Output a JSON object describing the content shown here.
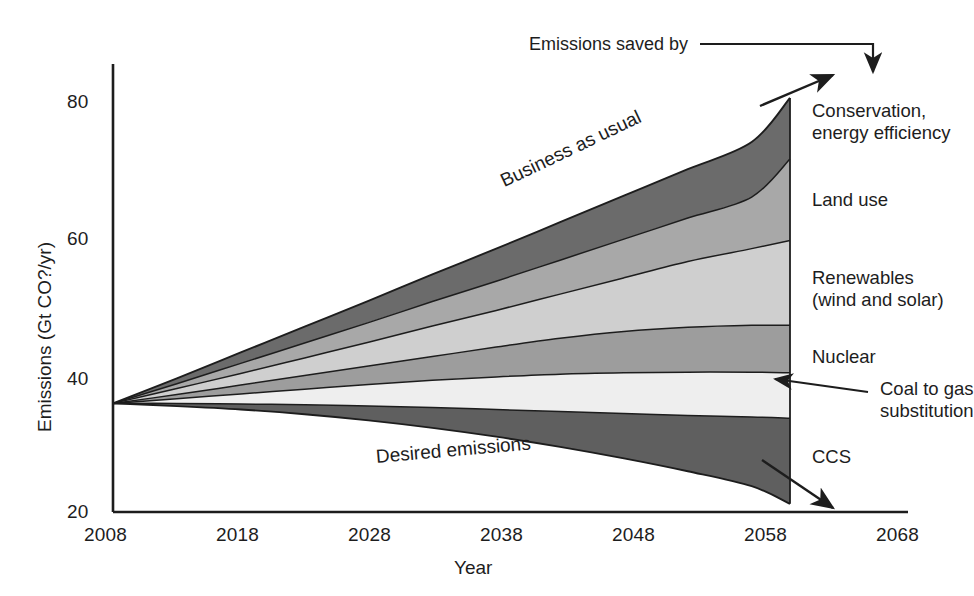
{
  "figure": {
    "background": "#ffffff",
    "ink": "#1d1d1d"
  },
  "axes": {
    "y_title": "Emissions (Gt CO?/yr)",
    "x_title": "Year",
    "y_ticks": [
      "80",
      "60",
      "40",
      "20"
    ],
    "x_ticks": [
      "2008",
      "2018",
      "2028",
      "2038",
      "2048",
      "2058",
      "2068"
    ]
  },
  "annotations": {
    "business_as_usual": "Business as usual",
    "desired_emissions": "Desired emissions",
    "emissions_saved_by": "Emissions saved by"
  },
  "band_labels": [
    {
      "id": "conservation",
      "line1": "Conservation,",
      "line2": "energy efficiency"
    },
    {
      "id": "land-use",
      "line1": "Land use",
      "line2": ""
    },
    {
      "id": "renewables",
      "line1": "Renewables",
      "line2": "(wind and solar)"
    },
    {
      "id": "nuclear",
      "line1": "Nuclear",
      "line2": ""
    },
    {
      "id": "coal-to-gas",
      "line1": "Coal to gas",
      "line2": "substitution"
    },
    {
      "id": "ccs",
      "line1": "CCS",
      "line2": ""
    }
  ],
  "chart_data": {
    "type": "area",
    "title": "",
    "xlabel": "Year",
    "ylabel": "Emissions (Gt CO?/yr)",
    "xlim": [
      2008,
      2068
    ],
    "ylim": [
      20,
      86
    ],
    "grid": false,
    "legend_position": "right-inline-labels",
    "x": [
      2008,
      2013,
      2018,
      2023,
      2028,
      2033,
      2038,
      2043,
      2048,
      2053,
      2058,
      2061
    ],
    "boundaries": [
      {
        "name": "Business as usual (top of stack)",
        "values": [
          36.0,
          39.7,
          43.5,
          47.3,
          51.1,
          55.0,
          58.8,
          62.7,
          66.6,
          70.5,
          74.5,
          81.0
        ]
      },
      {
        "name": "Top of Land use band",
        "values": [
          36.0,
          38.9,
          41.9,
          44.9,
          47.9,
          51.0,
          54.0,
          57.1,
          60.2,
          63.3,
          66.4,
          72.0
        ]
      },
      {
        "name": "Top of Renewables band",
        "values": [
          36.0,
          38.2,
          40.4,
          42.7,
          45.0,
          47.4,
          49.7,
          52.1,
          54.5,
          56.9,
          58.8,
          60.0
        ]
      },
      {
        "name": "Top of Nuclear band",
        "values": [
          36.0,
          37.3,
          38.7,
          40.1,
          41.5,
          42.9,
          44.3,
          45.6,
          46.6,
          47.2,
          47.5,
          47.5
        ]
      },
      {
        "name": "Top of Coal to gas substitution band",
        "values": [
          36.0,
          36.7,
          37.4,
          38.1,
          38.8,
          39.4,
          39.9,
          40.3,
          40.5,
          40.6,
          40.6,
          40.5
        ]
      },
      {
        "name": "Desired emissions (bottom of savings wedge)",
        "values": [
          36.0,
          36.0,
          35.9,
          35.8,
          35.6,
          35.4,
          35.1,
          34.8,
          34.5,
          34.2,
          34.0,
          33.8
        ]
      },
      {
        "name": "Bottom of CCS band",
        "values": [
          36.0,
          35.6,
          35.1,
          34.4,
          33.5,
          32.4,
          31.1,
          29.6,
          27.9,
          26.0,
          23.8,
          21.2
        ]
      }
    ],
    "bands": [
      {
        "name": "Conservation, energy efficiency",
        "color": "#6b6b6b",
        "between": [
          0,
          1
        ]
      },
      {
        "name": "Land use",
        "color": "#a8a8a8",
        "between": [
          1,
          2
        ]
      },
      {
        "name": "Renewables (wind and solar)",
        "color": "#cfcfcf",
        "between": [
          2,
          3
        ]
      },
      {
        "name": "Nuclear",
        "color": "#9d9d9d",
        "between": [
          3,
          4
        ]
      },
      {
        "name": "Coal to gas substitution",
        "color": "#eeeeee",
        "between": [
          4,
          5
        ]
      },
      {
        "name": "CCS",
        "color": "#5f5f5f",
        "between": [
          5,
          6
        ]
      }
    ]
  }
}
